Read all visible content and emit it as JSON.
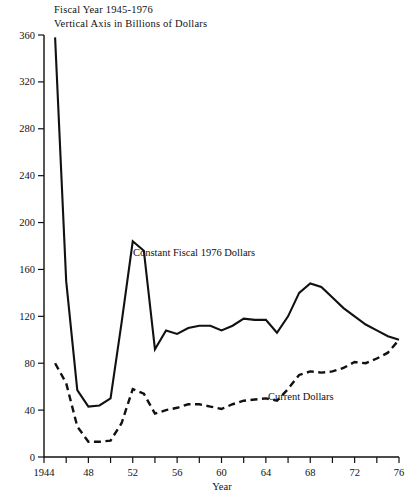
{
  "header": {
    "line1": "Fiscal Year 1945-1976",
    "line2": "Vertical Axis in Billions of Dollars"
  },
  "annotations": {
    "constant": "Constant Fiscal 1976 Dollars",
    "current": "Current Dollars"
  },
  "colors": {
    "ink": "#111111",
    "background": "#ffffff"
  },
  "chart_data": {
    "type": "line",
    "title": "Fiscal Year 1945-1976",
    "subtitle": "Vertical Axis in Billions of Dollars",
    "xlabel": "Year",
    "ylabel": "",
    "xlim": [
      1944,
      1976
    ],
    "ylim": [
      0,
      360
    ],
    "grid": false,
    "legend_position": "inline-annotations",
    "x_tick_step": 2,
    "x_label_step": 4,
    "y_tick_step": 40,
    "x_ticks": [
      1944,
      1946,
      1948,
      1950,
      1952,
      1954,
      1956,
      1958,
      1960,
      1962,
      1964,
      1966,
      1968,
      1970,
      1972,
      1974,
      1976
    ],
    "x_tick_labels": [
      "1944",
      "",
      "48",
      "",
      "52",
      "",
      "56",
      "",
      "60",
      "",
      "64",
      "",
      "68",
      "",
      "72",
      "",
      "76"
    ],
    "y_ticks": [
      0,
      40,
      80,
      120,
      160,
      200,
      240,
      280,
      320,
      360
    ],
    "y_tick_labels": [
      "0",
      "40",
      "80",
      "120",
      "160",
      "200",
      "240",
      "280",
      "320",
      "360"
    ],
    "x": [
      1945,
      1946,
      1947,
      1948,
      1949,
      1950,
      1951,
      1952,
      1953,
      1954,
      1955,
      1956,
      1957,
      1958,
      1959,
      1960,
      1961,
      1962,
      1963,
      1964,
      1965,
      1966,
      1967,
      1968,
      1969,
      1970,
      1971,
      1972,
      1973,
      1974,
      1975,
      1976
    ],
    "series": [
      {
        "name": "Constant Fiscal 1976 Dollars",
        "style": "solid",
        "values": [
          358,
          150,
          57,
          43,
          44,
          50,
          115,
          184,
          176,
          92,
          108,
          105,
          110,
          112,
          112,
          108,
          112,
          118,
          117,
          117,
          106,
          120,
          140,
          148,
          145,
          136,
          127,
          120,
          113,
          108,
          103,
          100
        ]
      },
      {
        "name": "Current Dollars",
        "style": "dashed",
        "values": [
          80,
          63,
          26,
          13,
          13,
          14,
          29,
          58,
          54,
          37,
          40,
          42,
          45,
          45,
          43,
          41,
          45,
          48,
          49,
          50,
          48,
          58,
          70,
          73,
          72,
          73,
          76,
          81,
          80,
          84,
          89,
          100
        ]
      }
    ],
    "notable_points": {
      "constant_peak_1945": 358,
      "constant_peak_1952": 184,
      "constant_trough_1948": 43,
      "constant_peak_1968": 148,
      "convergence_1976": 100
    }
  }
}
